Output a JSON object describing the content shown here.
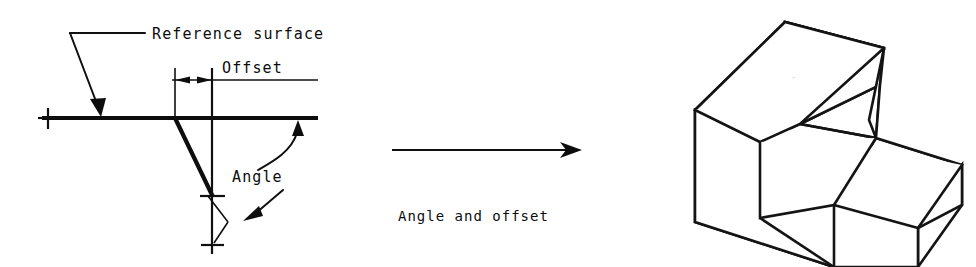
{
  "figure": {
    "title": "Angle and offset",
    "background_color": "#ffffff",
    "line_color": "#101010",
    "width": 976,
    "height": 267
  },
  "labels": {
    "reference_surface": "Reference surface",
    "offset": "Offset",
    "angle": "Angle",
    "transition": "Angle and offset"
  },
  "icons": {
    "leader_arrow": "arrowhead-icon",
    "dimension_arrow": "dimension-arrow-icon",
    "transition_arrow": "right-arrow-icon",
    "tick": "center-tick-icon"
  },
  "left_view": {
    "name": "cross-section-profile",
    "description": "2D profile showing a horizontal reference surface, an offset dimension and an angled face",
    "reference_line": {
      "x1": 38,
      "y1": 118,
      "x2": 318,
      "y2": 118
    },
    "vertex": {
      "x": 175,
      "y": 118
    },
    "angled_face": {
      "x1": 175,
      "y1": 118,
      "x2": 212,
      "y2": 196
    },
    "centerline": {
      "x": 212,
      "y1": 70,
      "y2": 254
    },
    "offset_extension_left_x": 175,
    "offset_extension_right_x": 212,
    "offset_dimension_y": 80
  },
  "right_view": {
    "name": "isometric-solid",
    "description": "Isometric stepped block with two chamfered angled faces produced by the angle and offset"
  },
  "transition": {
    "arrow": {
      "x1": 392,
      "y1": 150,
      "x2": 580,
      "y2": 150
    },
    "caption_x": 398,
    "caption_y": 216
  }
}
